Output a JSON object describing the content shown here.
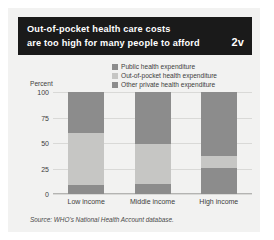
{
  "header": {
    "title_line1": "Out-of-pocket health care costs",
    "title_line2": "are too high for many people to afford",
    "badge": "2v",
    "bg_color": "#1a1a1a",
    "text_color": "#ffffff"
  },
  "figure": {
    "panel_color": "#f2f2f1",
    "source": "Source: WHO's National Health Account database."
  },
  "legend": {
    "items": [
      {
        "label": "Public health expenditure",
        "color": "#8c8c8c"
      },
      {
        "label": "Out-of-pocket health expenditure",
        "color": "#c6c6c4"
      },
      {
        "label": "Other private health expenditure",
        "color": "#8c8c8c"
      }
    ]
  },
  "chart_data": {
    "type": "bar",
    "subtype": "stacked-100-percent",
    "title": "Out-of-pocket health care costs are too high for many people to afford",
    "xlabel": "",
    "ylabel": "Percent",
    "ylim": [
      0,
      100
    ],
    "yticks": [
      0,
      25,
      50,
      75,
      100
    ],
    "ytick_labels": [
      "0",
      "25",
      "50",
      "75",
      "100"
    ],
    "grid": true,
    "legend_position": "top-right",
    "categories": [
      "Low income",
      "Middle income",
      "High income"
    ],
    "series": [
      {
        "name": "Public health expenditure",
        "color": "#8c8c8c",
        "values": [
          9,
          10,
          25
        ]
      },
      {
        "name": "Out-of-pocket health expenditure",
        "color": "#c6c6c4",
        "values": [
          51,
          39,
          12
        ]
      },
      {
        "name": "Other private health expenditure",
        "color": "#8c8c8c",
        "values": [
          40,
          51,
          63
        ]
      }
    ],
    "source": "Source: WHO's National Health Account database."
  }
}
